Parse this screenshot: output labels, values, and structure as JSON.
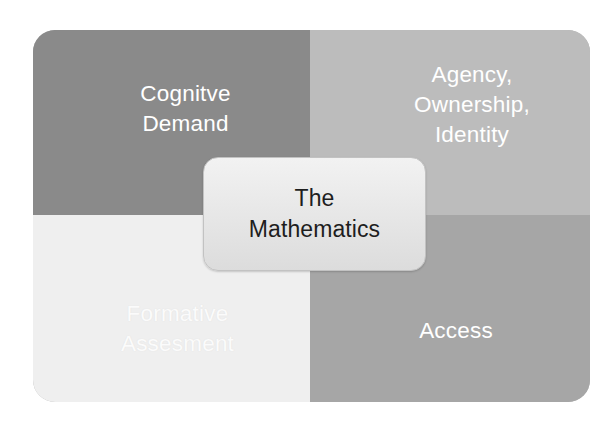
{
  "diagram": {
    "type": "quadrant-matrix",
    "center": {
      "label": "The\nMathematics",
      "text_color": "#1e1e1e",
      "fill_color": "#e8e8e8"
    },
    "quadrants": [
      {
        "position": "top-left",
        "label": "Cognitve\nDemand",
        "fill_color": "#8a8a8a",
        "text_color": "#ffffff"
      },
      {
        "position": "top-right",
        "label": "Agency,\nOwnership,\nIdentity",
        "fill_color": "#bcbcbc",
        "text_color": "#ffffff"
      },
      {
        "position": "bottom-left",
        "label": "Formative\nAssesment",
        "fill_color": "#efefef",
        "text_color": "#fbfbfb"
      },
      {
        "position": "bottom-right",
        "label": "Access",
        "fill_color": "#a6a6a6",
        "text_color": "#ffffff"
      }
    ]
  }
}
